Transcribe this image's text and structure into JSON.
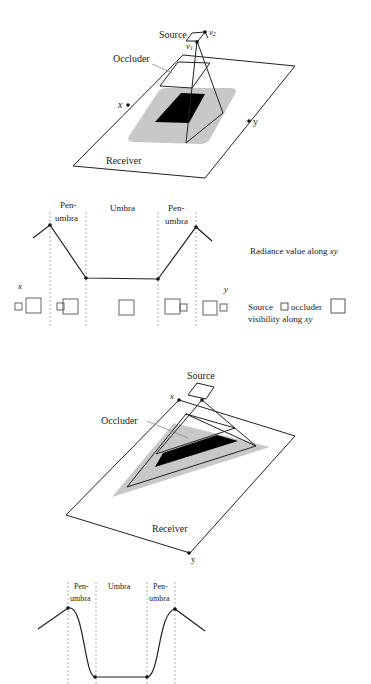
{
  "figure1": {
    "labels": {
      "source": "Source",
      "v1": "v",
      "v1_sub": "1",
      "v2": "v",
      "v2_sub": "2",
      "occluder": "Occluder",
      "receiver": "Receiver",
      "x": "x",
      "y": "y"
    },
    "colors": {
      "umbra": "#000000",
      "penumbra": "#c8c8c8",
      "lines": "#222222"
    }
  },
  "plot1": {
    "region_labels": {
      "penumbra_left_1": "Pen-",
      "penumbra_left_2": "umbra",
      "umbra": "Umbra",
      "penumbra_right_1": "Pen-",
      "penumbra_right_2": "umbra"
    },
    "x_label": "x",
    "y_label": "y",
    "radiance_caption": "Radiance value along ",
    "radiance_caption_var": "xy",
    "visibility_caption_1a": "Source",
    "visibility_caption_1b": "occluder",
    "visibility_caption_2": "visibility along ",
    "visibility_caption_var": "xy",
    "profile_type": "piecewise-linear"
  },
  "figure2": {
    "labels": {
      "source": "Source",
      "occluder": "Occluder",
      "receiver": "Receiver",
      "x": "x",
      "y": "y"
    },
    "colors": {
      "umbra": "#000000",
      "penumbra": "#c8c8c8",
      "lines": "#222222"
    }
  },
  "plot2": {
    "region_labels": {
      "penumbra_left_1": "Pen-",
      "penumbra_left_2": "umbra",
      "umbra": "Umbra",
      "penumbra_right_1": "Pen-",
      "penumbra_right_2": "umbra"
    },
    "profile_type": "smooth"
  }
}
